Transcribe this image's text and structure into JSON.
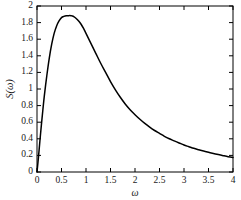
{
  "chart_data": {
    "type": "line",
    "title": "",
    "xlabel": "ω",
    "ylabel": "S(ω)",
    "xlim": [
      0,
      4
    ],
    "ylim": [
      0,
      2
    ],
    "grid": false,
    "legend": null,
    "xticks": [
      "0",
      "0.5",
      "1",
      "1.5",
      "2",
      "2.5",
      "3",
      "3.5",
      "4"
    ],
    "xtick_values": [
      0,
      0.5,
      1,
      1.5,
      2,
      2.5,
      3,
      3.5,
      4
    ],
    "yticks": [
      "0",
      "0.2",
      "0.4",
      "0.6",
      "0.8",
      "1",
      "1.2",
      "1.4",
      "1.6",
      "1.8",
      "2"
    ],
    "ytick_values": [
      0,
      0.2,
      0.4,
      0.6,
      0.8,
      1,
      1.2,
      1.4,
      1.6,
      1.8,
      2
    ],
    "series": [
      {
        "name": "S(ω)",
        "color": "#000000",
        "x": [
          0,
          0.03,
          0.06,
          0.09,
          0.12,
          0.15,
          0.2,
          0.25,
          0.3,
          0.35,
          0.4,
          0.45,
          0.5,
          0.55,
          0.6,
          0.65,
          0.7,
          0.72,
          0.75,
          0.8,
          0.85,
          0.9,
          0.95,
          1.0,
          1.1,
          1.2,
          1.3,
          1.4,
          1.5,
          1.6,
          1.7,
          1.8,
          1.9,
          2.0,
          2.1,
          2.2,
          2.3,
          2.4,
          2.5,
          2.6,
          2.7,
          2.8,
          2.9,
          3.0,
          3.1,
          3.2,
          3.3,
          3.4,
          3.5,
          3.6,
          3.7,
          3.8,
          3.9,
          4.0
        ],
        "y": [
          0,
          0.18,
          0.38,
          0.57,
          0.75,
          0.92,
          1.16,
          1.37,
          1.54,
          1.67,
          1.76,
          1.82,
          1.86,
          1.875,
          1.882,
          1.884,
          1.883,
          1.88,
          1.872,
          1.85,
          1.82,
          1.78,
          1.73,
          1.67,
          1.55,
          1.43,
          1.31,
          1.2,
          1.09,
          0.99,
          0.9,
          0.82,
          0.75,
          0.69,
          0.635,
          0.585,
          0.54,
          0.5,
          0.465,
          0.43,
          0.4,
          0.375,
          0.35,
          0.325,
          0.305,
          0.285,
          0.268,
          0.252,
          0.237,
          0.223,
          0.21,
          0.197,
          0.185,
          0.175
        ]
      }
    ],
    "peak": {
      "x": 0.72,
      "y": 1.88
    },
    "endpoint": {
      "x": 4,
      "y": 0.13
    }
  },
  "axes": {
    "frame_color": "#000000",
    "tick_direction": "in"
  }
}
